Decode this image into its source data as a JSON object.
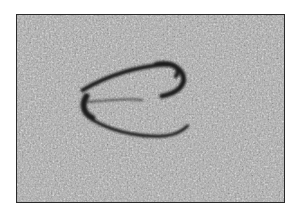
{
  "image": {
    "description": "Grayscale grainy micrograph showing a dark-outlined curved particle / vesicle in the center",
    "colors": {
      "background": "#a8a8a8",
      "outline": "#1e1e1e",
      "border": "#2a2a2a",
      "page": "#ffffff"
    }
  }
}
